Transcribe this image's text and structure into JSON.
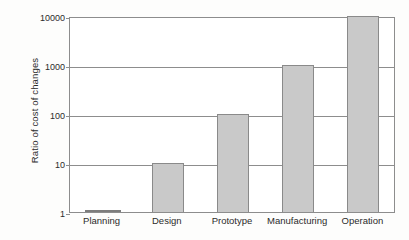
{
  "chart_data": {
    "type": "bar",
    "title": "",
    "xlabel": "",
    "ylabel": "Ratio of cost of changes",
    "categories": [
      "Planning",
      "Design",
      "Prototype",
      "Manufacturing",
      "Operation"
    ],
    "values": [
      1,
      10,
      100,
      1000,
      10000
    ],
    "yscale": "log",
    "ylim": [
      1,
      10000
    ],
    "yticks": [
      1,
      10,
      100,
      1000,
      10000
    ],
    "ytick_labels": [
      "1",
      "10",
      "100",
      "1000",
      "10000"
    ],
    "grid": "horizontal",
    "legend": "none",
    "series": [
      {
        "name": "Ratio of cost of changes",
        "values": [
          1,
          10,
          100,
          1000,
          10000
        ]
      }
    ],
    "colors": {
      "bar_fill": "#c9c9c9",
      "bar_stroke": "#8a8a8a",
      "axis": "#8d8d8d",
      "text": "#2b2b2b",
      "background": "#fdfdfc"
    }
  }
}
